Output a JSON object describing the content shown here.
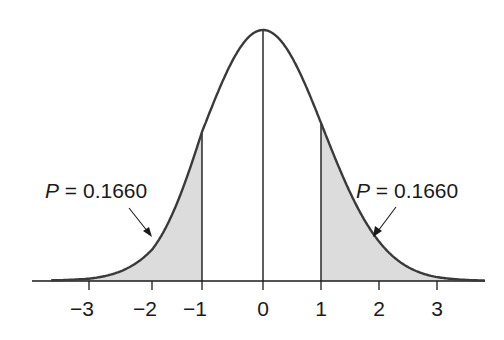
{
  "chart_data": {
    "type": "area",
    "title": "",
    "xlabel": "",
    "ylabel": "",
    "x_ticks": [
      -3,
      -2,
      -1,
      0,
      1,
      2,
      3
    ],
    "x_tick_labels": [
      "−3",
      "−2",
      "−1",
      "0",
      "1",
      "2",
      "3"
    ],
    "shaded_regions": [
      {
        "name": "left-tail",
        "from": "-inf",
        "to": -1,
        "label": "P = 0.1660",
        "p_value": 0.166
      },
      {
        "name": "right-tail",
        "from": 1,
        "to": "inf",
        "label": "P = 0.1660",
        "p_value": 0.166
      }
    ],
    "vertical_lines": [
      -1,
      0,
      1
    ],
    "annotations": [
      {
        "text_var": "P",
        "text_eq": " = ",
        "text_val": "0.1660",
        "points_to": "left-tail"
      },
      {
        "text_var": "P",
        "text_eq": " = ",
        "text_val": "0.1660",
        "points_to": "right-tail"
      }
    ],
    "grid": false,
    "legend": null,
    "colors": {
      "curve": "#3a3a3a",
      "shade": "#dcdcdc",
      "axis": "#1a1a1a"
    }
  }
}
